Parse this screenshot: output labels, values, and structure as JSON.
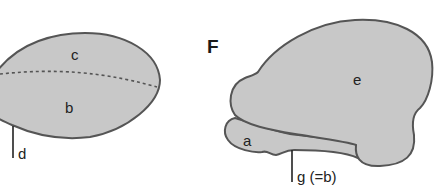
{
  "colors": {
    "fill": "#c8c8c8",
    "stroke": "#555555",
    "text": "#222222",
    "background": "#ffffff"
  },
  "left_panel": {
    "labels": {
      "c": "c",
      "b": "b",
      "d": "d"
    }
  },
  "right_panel": {
    "panel_letter": "F",
    "labels": {
      "e": "e",
      "a": "a",
      "g": "g (=b)"
    }
  }
}
